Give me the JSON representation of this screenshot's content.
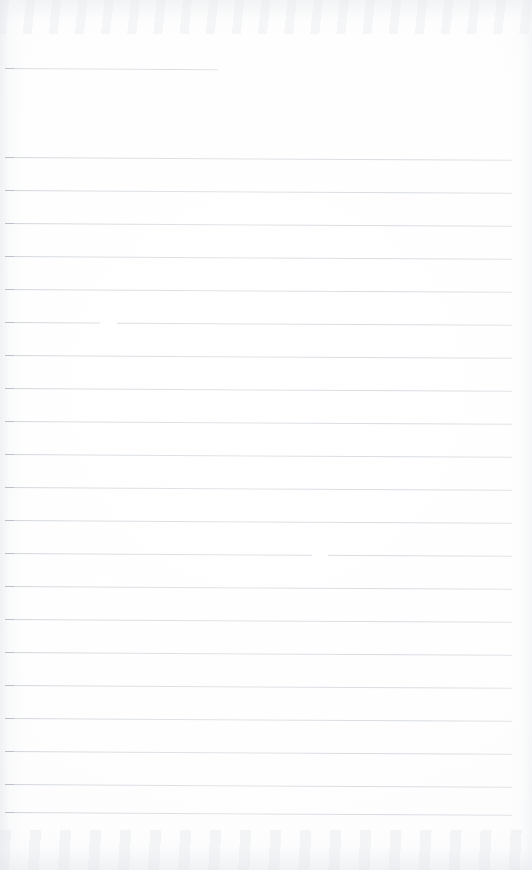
{
  "document": {
    "kind": "scanned-lined-notebook-page",
    "title": "Blank ruled notebook page",
    "visible_text": "",
    "page_width": 532,
    "page_height": 870,
    "paper_color": "#ffffff",
    "rule_color": "#d5dadf",
    "rule_thickness_px": 1,
    "rule_spacing_px": 33,
    "rule_slope_deg": 0.32,
    "left_margin_px": 5,
    "right_edge_px": 512,
    "total_rules": 23
  },
  "rules": [
    {
      "name": "rule-1",
      "y": 68,
      "x_start": 5,
      "x_end": 218,
      "full_width": false
    },
    {
      "name": "rule-2",
      "y": 157,
      "x_start": 5,
      "x_end": 512,
      "full_width": true
    },
    {
      "name": "rule-3",
      "y": 190,
      "x_start": 5,
      "x_end": 512,
      "full_width": true
    },
    {
      "name": "rule-4",
      "y": 223,
      "x_start": 5,
      "x_end": 512,
      "full_width": true
    },
    {
      "name": "rule-5",
      "y": 256,
      "x_start": 5,
      "x_end": 512,
      "full_width": true
    },
    {
      "name": "rule-6",
      "y": 289,
      "x_start": 5,
      "x_end": 512,
      "full_width": true
    },
    {
      "name": "rule-7",
      "y": 322,
      "x_start": 5,
      "x_end": 512,
      "full_width": true
    },
    {
      "name": "rule-8",
      "y": 355,
      "x_start": 5,
      "x_end": 512,
      "full_width": true
    },
    {
      "name": "rule-9",
      "y": 388,
      "x_start": 5,
      "x_end": 512,
      "full_width": true
    },
    {
      "name": "rule-10",
      "y": 421,
      "x_start": 5,
      "x_end": 512,
      "full_width": true
    },
    {
      "name": "rule-11",
      "y": 454,
      "x_start": 5,
      "x_end": 512,
      "full_width": true
    },
    {
      "name": "rule-12",
      "y": 487,
      "x_start": 5,
      "x_end": 512,
      "full_width": true
    },
    {
      "name": "rule-13",
      "y": 520,
      "x_start": 5,
      "x_end": 512,
      "full_width": true
    },
    {
      "name": "rule-14",
      "y": 553,
      "x_start": 5,
      "x_end": 512,
      "full_width": true
    },
    {
      "name": "rule-15",
      "y": 586,
      "x_start": 5,
      "x_end": 512,
      "full_width": true
    },
    {
      "name": "rule-16",
      "y": 619,
      "x_start": 5,
      "x_end": 512,
      "full_width": true
    },
    {
      "name": "rule-17",
      "y": 652,
      "x_start": 5,
      "x_end": 512,
      "full_width": true
    },
    {
      "name": "rule-18",
      "y": 685,
      "x_start": 5,
      "x_end": 512,
      "full_width": true
    },
    {
      "name": "rule-19",
      "y": 718,
      "x_start": 5,
      "x_end": 512,
      "full_width": true
    },
    {
      "name": "rule-20",
      "y": 751,
      "x_start": 5,
      "x_end": 512,
      "full_width": true
    },
    {
      "name": "rule-21",
      "y": 784,
      "x_start": 5,
      "x_end": 512,
      "full_width": true
    },
    {
      "name": "rule-22",
      "y": 812,
      "x_start": 5,
      "x_end": 512,
      "full_width": true
    }
  ],
  "scan_artifacts": {
    "top_band": {
      "name": "top-scan-shadow",
      "y": 0,
      "height": 34
    },
    "bottom_band": {
      "name": "bottom-scan-shadow",
      "y": 830,
      "height": 40
    },
    "left_edge": {
      "name": "left-scan-shadow",
      "x": 0,
      "width": 26
    },
    "right_edge": {
      "name": "right-scan-shadow",
      "x": 508,
      "width": 24
    },
    "rule_dropouts": [
      {
        "name": "dropout-a",
        "x": 326,
        "y": 289,
        "width": 14
      },
      {
        "name": "dropout-b",
        "x": 100,
        "y": 323,
        "width": 17
      },
      {
        "name": "dropout-c",
        "x": 312,
        "y": 555,
        "width": 16
      },
      {
        "name": "dropout-d",
        "x": 96,
        "y": 583,
        "width": 15
      }
    ]
  }
}
